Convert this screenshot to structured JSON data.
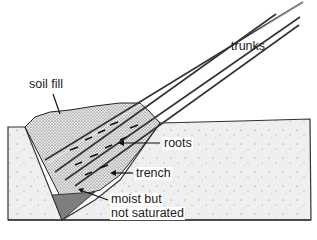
{
  "diagram": {
    "labels": {
      "trunks": "trunks",
      "soil_fill": "soil fill",
      "roots": "roots",
      "trench": "trench",
      "moist_line1": "moist but",
      "moist_line2": "not saturated"
    },
    "colors": {
      "ink": "#1a1a1a",
      "ground_fill": "#eeeeee",
      "soil_fill": "#cfcfcf",
      "moist_zone": "#9a9a9a",
      "background": "#ffffff"
    }
  }
}
